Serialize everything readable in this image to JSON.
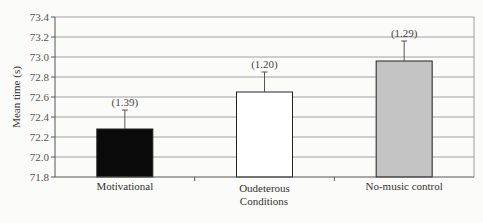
{
  "chart_data": {
    "type": "bar",
    "title": "",
    "xlabel": "Conditions",
    "ylabel": "Mean time (s)",
    "ylim": [
      71.8,
      73.4
    ],
    "yticks": [
      71.8,
      72.0,
      72.2,
      72.4,
      72.6,
      72.8,
      73.0,
      73.2,
      73.4
    ],
    "ytick_labels": [
      "71.8",
      "72.0",
      "72.2",
      "72.4",
      "72.6",
      "72.8",
      "73.0",
      "73.2",
      "73.4"
    ],
    "grid": true,
    "legend": null,
    "categories": [
      "Motivational",
      "Oudeterous",
      "No-music control"
    ],
    "values": [
      72.28,
      72.65,
      72.96
    ],
    "error_bars": [
      0.19,
      0.2,
      0.2
    ],
    "error_labels": [
      "(1.39)",
      "(1.20)",
      "(1.29)"
    ],
    "bar_colors": [
      "#0a0a0a",
      "#ffffff",
      "#c4c4c4"
    ]
  },
  "colors": {
    "grid": "#8a8a8a",
    "axis": "#555555",
    "bar_stroke": "#222222",
    "background": "#fbfbfa"
  }
}
